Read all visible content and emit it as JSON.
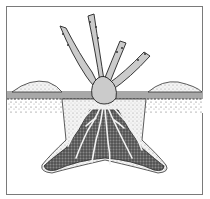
{
  "illustration": {
    "subject": "rose bush planted in hole with roots spread over soil mound",
    "colors": {
      "frame": "#7a7a7a",
      "stem": "#c8c8c8",
      "soil_surface": "#9a9a9a",
      "soil_dark": "#5a5a5a",
      "roots": "#eeeeee",
      "background": "#ffffff"
    }
  }
}
